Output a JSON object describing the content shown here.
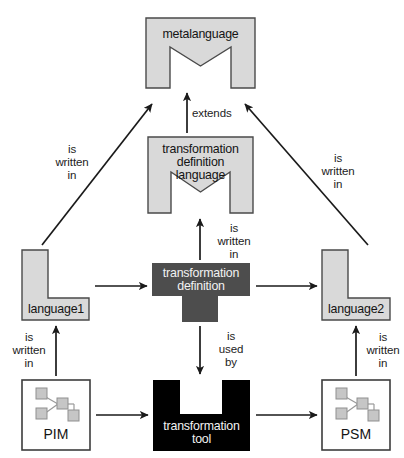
{
  "diagram": {
    "colors": {
      "language_fill": "#d9d9d9",
      "language_stroke": "#4a4a4a",
      "definition_fill": "#4d4d4d",
      "tool_fill": "#000000",
      "model_box_fill": "#ffffff",
      "model_box_stroke": "#3c3c3c",
      "model_icon_fill": "#c6c6c6",
      "model_icon_stroke": "#8a8a8a",
      "arrow_color": "#1a1a1a",
      "text_dark": "#141414",
      "text_light": "#f2f2f2",
      "page_background": "#ffffff"
    },
    "nodes": [
      {
        "id": "metalanguage",
        "label": "metalanguage",
        "shape": "m-shape",
        "fill": "#d9d9d9"
      },
      {
        "id": "transformation-definition-language",
        "label": "transformation\ndefinition\nlanguage",
        "label_line1": "transformation",
        "label_line2": "definition",
        "label_line3": "language",
        "shape": "m-shape",
        "fill": "#d9d9d9"
      },
      {
        "id": "language1",
        "label": "language1",
        "shape": "l-shape",
        "fill": "#d9d9d9"
      },
      {
        "id": "language2",
        "label": "language2",
        "shape": "l-shape",
        "fill": "#d9d9d9"
      },
      {
        "id": "transformation-definition",
        "label": "transformation\ndefinition",
        "label_line1": "transformation",
        "label_line2": "definition",
        "shape": "t-shape",
        "fill": "#4d4d4d"
      },
      {
        "id": "transformation-tool",
        "label": "transformation\ntool",
        "label_line1": "transformation",
        "label_line2": "tool",
        "shape": "u-shape",
        "fill": "#000000"
      },
      {
        "id": "pim",
        "label": "PIM",
        "shape": "model-box",
        "icon": "model-graph-icon",
        "fill": "#ffffff"
      },
      {
        "id": "psm",
        "label": "PSM",
        "shape": "model-box",
        "icon": "model-graph-icon",
        "fill": "#ffffff"
      }
    ],
    "edges": [
      {
        "id": "tdl-extends-metalanguage",
        "from": "transformation-definition-language",
        "to": "metalanguage",
        "label": "extends",
        "label_lines": [
          "extends"
        ]
      },
      {
        "id": "language1-written-in-metalanguage",
        "from": "language1",
        "to": "metalanguage",
        "label": "is\nwritten\nin",
        "label_lines": [
          "is",
          "written",
          "in"
        ]
      },
      {
        "id": "language2-written-in-metalanguage",
        "from": "language2",
        "to": "metalanguage",
        "label": "is\nwritten\nin",
        "label_lines": [
          "is",
          "written",
          "in"
        ]
      },
      {
        "id": "td-written-in-tdl",
        "from": "transformation-definition",
        "to": "transformation-definition-language",
        "label": "is\nwritten\nin",
        "label_lines": [
          "is",
          "written",
          "in"
        ]
      },
      {
        "id": "td-used-by-tool",
        "from": "transformation-definition",
        "to": "transformation-tool",
        "label": "is\nused\nby",
        "label_lines": [
          "is",
          "used",
          "by"
        ]
      },
      {
        "id": "pim-written-in-language1",
        "from": "pim",
        "to": "language1",
        "label": "is\nwritten\nin",
        "label_lines": [
          "is",
          "written",
          "in"
        ]
      },
      {
        "id": "psm-written-in-language2",
        "from": "psm",
        "to": "language2",
        "label": "is\nwritten\nin",
        "label_lines": [
          "is",
          "written",
          "in"
        ]
      },
      {
        "id": "language1-to-td",
        "from": "language1",
        "to": "transformation-definition",
        "label": "",
        "label_lines": []
      },
      {
        "id": "td-to-language2",
        "from": "transformation-definition",
        "to": "language2",
        "label": "",
        "label_lines": []
      },
      {
        "id": "pim-to-tool",
        "from": "pim",
        "to": "transformation-tool",
        "label": "",
        "label_lines": []
      },
      {
        "id": "tool-to-psm",
        "from": "transformation-tool",
        "to": "psm",
        "label": "",
        "label_lines": []
      }
    ],
    "labels": {
      "extends": "extends",
      "is": "is",
      "written": "written",
      "in": "in",
      "used": "used",
      "by": "by"
    }
  }
}
